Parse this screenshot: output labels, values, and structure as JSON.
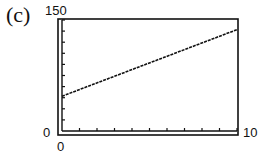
{
  "panel": {
    "label": "(c)"
  },
  "axes": {
    "ymax_label": "150",
    "ymin_label": "0",
    "xmin_label": "0",
    "xmax_label": "10"
  },
  "chart_data": {
    "type": "line",
    "title": "(c)",
    "xlabel": "",
    "ylabel": "",
    "xlim": [
      0,
      10
    ],
    "ylim": [
      0,
      150
    ],
    "x_ticks": 10,
    "y_ticks": 10,
    "grid": false,
    "series": [
      {
        "name": "line",
        "x": [
          0,
          10
        ],
        "values": [
          47,
          137
        ]
      }
    ]
  }
}
